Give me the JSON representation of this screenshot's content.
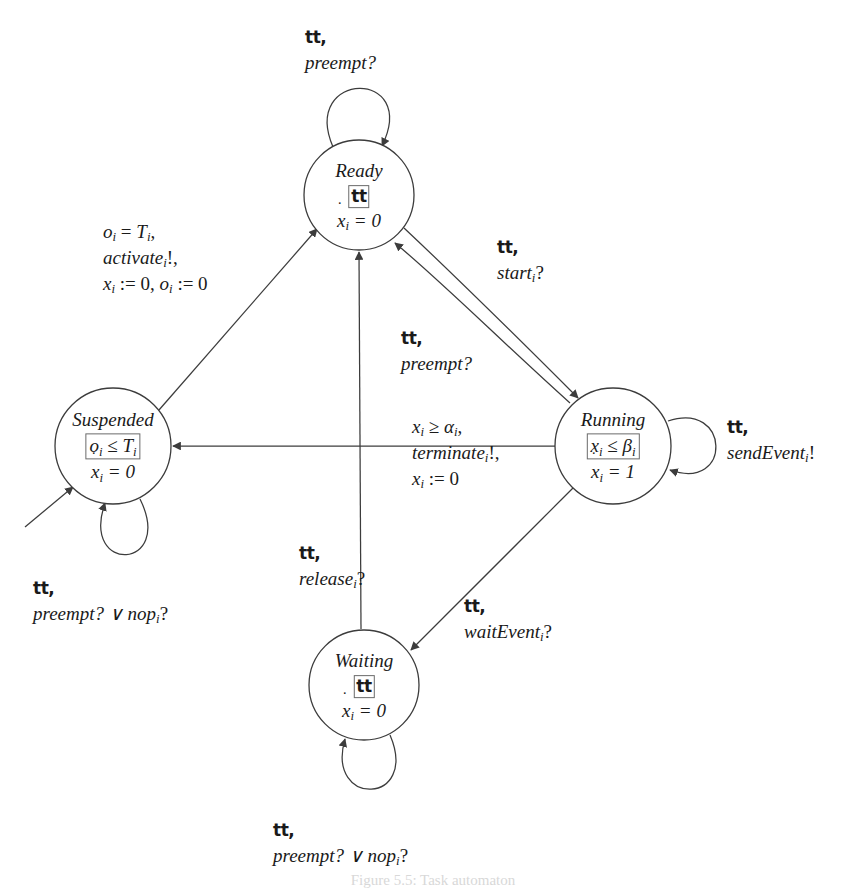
{
  "figure": {
    "type": "hybrid-automaton-state-diagram",
    "caption": "Figure 5.5: Task automaton"
  },
  "colors": {
    "stroke": "#3c3c3c",
    "text": "#1a1a1a",
    "node_fill": "#ffffff",
    "invariant_box_border": "#6a6a6a"
  },
  "states": [
    {
      "id": "ready",
      "name": "Ready",
      "invariant": "tt",
      "invariant_boxed": true,
      "flow_var": "x",
      "flow_sub": "i",
      "flow_value": "= 0",
      "cx": 359,
      "cy": 195,
      "r": 55
    },
    {
      "id": "suspended",
      "name": "Suspended",
      "invariant_lhs": "o",
      "invariant_lhs_sub": "i",
      "invariant_rel": "≤",
      "invariant_rhs": "T",
      "invariant_rhs_sub": "i",
      "invariant_boxed": true,
      "flow_var": "x",
      "flow_sub": "i",
      "flow_value": "= 0",
      "cx": 113,
      "cy": 446,
      "r": 58
    },
    {
      "id": "running",
      "name": "Running",
      "invariant_lhs": "x",
      "invariant_lhs_sub": "i",
      "invariant_rel": "≤",
      "invariant_rhs": "β",
      "invariant_rhs_sub": "i",
      "invariant_boxed": true,
      "flow_var": "x",
      "flow_sub": "i",
      "flow_value": "= 1",
      "cx": 613,
      "cy": 446,
      "r": 58
    },
    {
      "id": "waiting",
      "name": "Waiting",
      "invariant": "tt",
      "invariant_boxed": true,
      "flow_var": "x",
      "flow_sub": "i",
      "flow_value": "= 0",
      "cx": 364,
      "cy": 685,
      "r": 55
    }
  ],
  "transitions": [
    {
      "id": "ready-self-preempt",
      "from": "ready",
      "to": "ready",
      "guard": "tt",
      "action": "preempt?",
      "label_lines": [
        "tt,",
        "preempt?"
      ]
    },
    {
      "id": "suspended-to-ready-activate",
      "from": "suspended",
      "to": "ready",
      "label_lines": [
        "o_i = T_i,",
        "activate_i!,",
        "x_i := 0, o_i := 0"
      ]
    },
    {
      "id": "ready-to-running-start",
      "from": "ready",
      "to": "running",
      "label_lines": [
        "tt,",
        "start_i?"
      ]
    },
    {
      "id": "running-to-ready-preempt",
      "from": "running",
      "to": "ready",
      "label_lines": [
        "tt,",
        "preempt?"
      ]
    },
    {
      "id": "running-to-suspended-terminate",
      "from": "running",
      "to": "suspended",
      "label_lines": [
        "x_i ≥ α_i,",
        "terminate_i!,",
        "x_i := 0"
      ]
    },
    {
      "id": "running-self-sendevent",
      "from": "running",
      "to": "running",
      "label_lines": [
        "tt,",
        "sendEvent_i!"
      ]
    },
    {
      "id": "running-to-waiting-waitevent",
      "from": "running",
      "to": "waiting",
      "label_lines": [
        "tt,",
        "waitEvent_i?"
      ]
    },
    {
      "id": "waiting-to-ready-release",
      "from": "waiting",
      "to": "ready",
      "label_lines": [
        "tt,",
        "release_i?"
      ]
    },
    {
      "id": "suspended-self-preempt-nop",
      "from": "suspended",
      "to": "suspended",
      "label_lines": [
        "tt,",
        "preempt? ∨ nop_i?"
      ]
    },
    {
      "id": "waiting-self-preempt-nop",
      "from": "waiting",
      "to": "waiting",
      "label_lines": [
        "tt,",
        "preempt? ∨ nop_i?"
      ]
    },
    {
      "id": "initial-arrow-suspended",
      "from": "initial",
      "to": "suspended",
      "label_lines": []
    }
  ],
  "labels": {
    "ready_self": {
      "l1": "tt,",
      "l2": "preempt?"
    },
    "activate": {
      "l1a": "o",
      "l1b": " = ",
      "l1c": "T",
      "l1d": ",",
      "l2": "activate",
      "l2b": "!,",
      "l3a": "x",
      "l3b": " := 0, ",
      "l3c": "o",
      "l3d": " := 0"
    },
    "start": {
      "l1": "tt,",
      "l2": "start",
      "l2b": "?"
    },
    "preempt_running": {
      "l1": "tt,",
      "l2": "preempt?"
    },
    "terminate": {
      "l1a": "x",
      "l1b": " ≥ ",
      "l1c": "α",
      "l1d": ",",
      "l2": "terminate",
      "l2b": "!,",
      "l3a": "x",
      "l3b": " := 0"
    },
    "send_event": {
      "l1": "tt,",
      "l2": "sendEvent",
      "l2b": "!"
    },
    "wait_event": {
      "l1": "tt,",
      "l2": "waitEvent",
      "l2b": "?"
    },
    "release": {
      "l1": "tt,",
      "l2": "release",
      "l2b": "?"
    },
    "suspended_self": {
      "l1": "tt,",
      "l2a": "preempt? ∨ nop",
      "l2b": "?"
    },
    "waiting_self": {
      "l1": "tt,",
      "l2a": "preempt? ∨ nop",
      "l2b": "?"
    },
    "sub_i": "i"
  },
  "node_labels": {
    "ready": {
      "name": "Ready",
      "inv": "tt",
      "flow_var": "x",
      "flow_rest": " = 0"
    },
    "suspended": {
      "name": "Suspended",
      "inv_a": "o",
      "inv_b": " ≤ ",
      "inv_c": "T",
      "flow_var": "x",
      "flow_rest": " = 0"
    },
    "running": {
      "name": "Running",
      "inv_a": "x",
      "inv_b": " ≤ ",
      "inv_c": "β",
      "flow_var": "x",
      "flow_rest": " = 1"
    },
    "waiting": {
      "name": "Waiting",
      "inv": "tt",
      "flow_var": "x",
      "flow_rest": " = 0"
    }
  }
}
